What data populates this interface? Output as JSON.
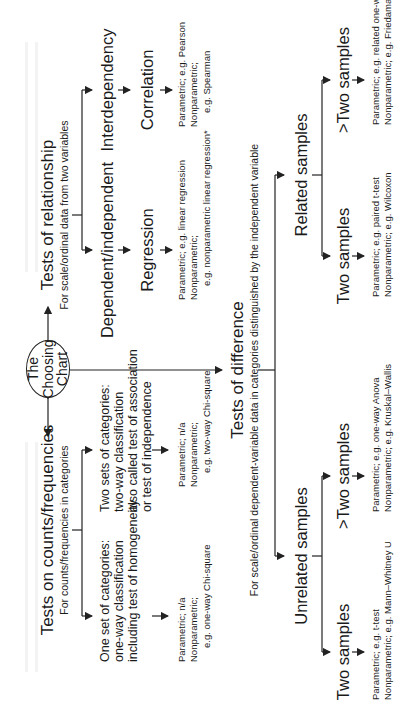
{
  "root": {
    "label_lines": [
      "The",
      "Choosing",
      "Chart"
    ]
  },
  "relationship": {
    "title": "Tests of relationship",
    "subtitle": "For scale/ordinal data from two variables",
    "branches": [
      {
        "label": "Dependent/independent",
        "next": "Regression",
        "notes": [
          "Parametric; e.g. linear regression",
          "Nonparametric;",
          "e.g. nonparametric linear regression*"
        ]
      },
      {
        "label": "Interdependency",
        "next": "Correlation",
        "notes": [
          "Parametric; e.g. Pearson",
          "Nonparametric;",
          "e.g. Spearman"
        ]
      }
    ]
  },
  "counts": {
    "title": "Tests on counts/frequencies",
    "subtitle": "For counts/frequencies in categories",
    "branches": [
      {
        "desc": [
          "One set of categories:",
          "one-way classification",
          "including test of homogeneity"
        ],
        "notes": [
          "Parametric; n/a",
          "Nonparametric;",
          "e.g. one-way Chi-square"
        ]
      },
      {
        "desc": [
          "Two sets of categories:",
          "two-way classification",
          "also called test of association",
          "or test of independence"
        ],
        "notes": [
          "Parametric; n/a",
          "Nonparametric;",
          "e.g. two-way Chi-square"
        ]
      }
    ]
  },
  "difference": {
    "title": "Tests of difference",
    "subtitle": "For scale/ordinal dependent-variable data in categories distinguished by the independent variable",
    "groups": [
      {
        "label": "Unrelated samples",
        "branches": [
          {
            "label": "Two samples",
            "notes": [
              "Parametric; e.g. t-test",
              "Nonparametric; e.g. Mann–Whitney U"
            ]
          },
          {
            "label": ">Two samples",
            "notes": [
              "Parametric; e.g. one-way Anova",
              "Nonparametric; e.g. Kruskal–Wallis"
            ]
          }
        ]
      },
      {
        "label": "Related samples",
        "branches": [
          {
            "label": "Two samples",
            "notes": [
              "Parametric; e.g. paired t-test",
              "Nonparametric; e.g. Wilcoxon"
            ]
          },
          {
            "label": ">Two samples",
            "notes": [
              "Parametric; e.g. related one-way Anova*",
              "Nonparametric; e.g. Friedaman Anova*"
            ]
          }
        ]
      }
    ]
  },
  "colors": {
    "line": "#222222",
    "text": "#1a1a1a",
    "background": "#ffffff"
  }
}
